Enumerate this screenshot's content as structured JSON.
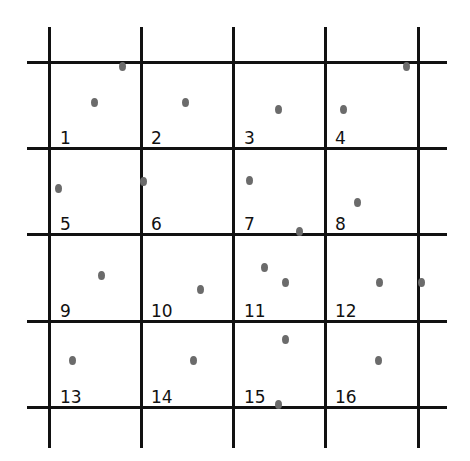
{
  "diagram": {
    "type": "grid-with-points",
    "rows": 4,
    "cols": 4,
    "vertical_lines_x": [
      49,
      141,
      233,
      325,
      418
    ],
    "vertical_extent": [
      27,
      448
    ],
    "horizontal_lines_y": [
      62,
      148,
      234,
      321,
      407
    ],
    "horizontal_extent": [
      27,
      447
    ],
    "cells": [
      {
        "label": "1",
        "x": 60,
        "y": 130
      },
      {
        "label": "2",
        "x": 151,
        "y": 130
      },
      {
        "label": "3",
        "x": 244,
        "y": 130
      },
      {
        "label": "4",
        "x": 335,
        "y": 130
      },
      {
        "label": "5",
        "x": 60,
        "y": 216
      },
      {
        "label": "6",
        "x": 151,
        "y": 216
      },
      {
        "label": "7",
        "x": 244,
        "y": 216
      },
      {
        "label": "8",
        "x": 335,
        "y": 216
      },
      {
        "label": "9",
        "x": 60,
        "y": 303
      },
      {
        "label": "10",
        "x": 151,
        "y": 303
      },
      {
        "label": "11",
        "x": 244,
        "y": 303
      },
      {
        "label": "12",
        "x": 335,
        "y": 303
      },
      {
        "label": "13",
        "x": 60,
        "y": 389
      },
      {
        "label": "14",
        "x": 151,
        "y": 389
      },
      {
        "label": "15",
        "x": 244,
        "y": 389
      },
      {
        "label": "16",
        "x": 335,
        "y": 389
      }
    ],
    "points": [
      [
        122,
        66
      ],
      [
        94,
        102
      ],
      [
        185,
        102
      ],
      [
        278,
        109
      ],
      [
        343,
        109
      ],
      [
        406,
        66
      ],
      [
        58,
        188
      ],
      [
        143,
        181
      ],
      [
        249,
        180
      ],
      [
        357,
        202
      ],
      [
        299,
        231
      ],
      [
        101,
        275
      ],
      [
        200,
        289
      ],
      [
        264,
        267
      ],
      [
        285,
        282
      ],
      [
        379,
        282
      ],
      [
        421,
        282
      ],
      [
        72,
        360
      ],
      [
        193,
        360
      ],
      [
        285,
        339
      ],
      [
        378,
        360
      ],
      [
        278,
        404
      ]
    ],
    "colors": {
      "line": "#111111",
      "point": "#6b6b6b",
      "background": "#ffffff"
    }
  }
}
